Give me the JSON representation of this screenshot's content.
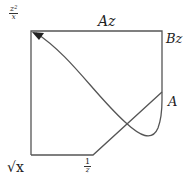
{
  "diagram": {
    "labels": {
      "top_left": {
        "numerator": "z",
        "numerator_exp": "2",
        "denominator": "x"
      },
      "top_edge": "Az",
      "right_top": "Bz",
      "right_mid": "A",
      "bottom_left": "√x",
      "bottom_mid": {
        "numerator": "1",
        "denominator": "z"
      }
    },
    "colors": {
      "stroke": "#555555",
      "text": "#222222",
      "background": "#ffffff"
    }
  }
}
